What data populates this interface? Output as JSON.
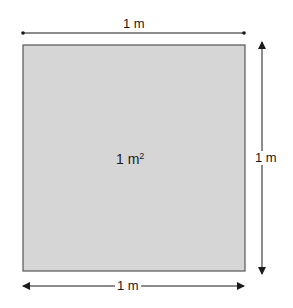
{
  "diagram": {
    "square": {
      "area_label": "1 m",
      "area_exponent": "2",
      "fill_color": "#d6d6d6",
      "border_color": "#555555"
    },
    "dimensions": {
      "top_width_label": "1 m",
      "right_height_label": "1 m",
      "bottom_width_label": "1 m"
    }
  }
}
